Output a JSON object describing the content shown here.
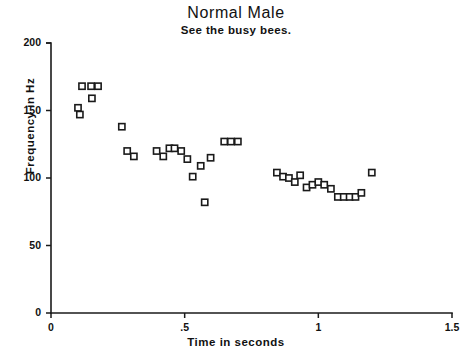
{
  "chart_data": {
    "type": "scatter",
    "title": "Normal Male",
    "subtitle": "See the busy bees.",
    "xlabel": "Time in seconds",
    "ylabel": "Frequency in Hz",
    "xlim": [
      0,
      1.5
    ],
    "ylim": [
      0,
      200
    ],
    "xticks": [
      0,
      0.5,
      1,
      1.5
    ],
    "xtick_labels": [
      "0",
      ".5",
      "1",
      "1.5"
    ],
    "yticks": [
      0,
      50,
      100,
      150,
      200
    ],
    "ytick_labels": [
      "0",
      "50",
      "100",
      "150",
      "200"
    ],
    "grid": false,
    "legend": null,
    "marker": "open-square",
    "marker_color": "#1a1a1a",
    "points": [
      {
        "x": 0.108,
        "y": 147
      },
      {
        "x": 0.116,
        "y": 168
      },
      {
        "x": 0.15,
        "y": 168
      },
      {
        "x": 0.176,
        "y": 168
      },
      {
        "x": 0.153,
        "y": 159
      },
      {
        "x": 0.101,
        "y": 152
      },
      {
        "x": 0.265,
        "y": 138
      },
      {
        "x": 0.285,
        "y": 120
      },
      {
        "x": 0.31,
        "y": 116
      },
      {
        "x": 0.395,
        "y": 120
      },
      {
        "x": 0.42,
        "y": 116
      },
      {
        "x": 0.443,
        "y": 122
      },
      {
        "x": 0.462,
        "y": 122
      },
      {
        "x": 0.487,
        "y": 120
      },
      {
        "x": 0.51,
        "y": 114
      },
      {
        "x": 0.53,
        "y": 101
      },
      {
        "x": 0.575,
        "y": 82
      },
      {
        "x": 0.56,
        "y": 109
      },
      {
        "x": 0.597,
        "y": 115
      },
      {
        "x": 0.648,
        "y": 127
      },
      {
        "x": 0.673,
        "y": 127
      },
      {
        "x": 0.699,
        "y": 127
      },
      {
        "x": 0.845,
        "y": 104
      },
      {
        "x": 0.868,
        "y": 101
      },
      {
        "x": 0.89,
        "y": 100
      },
      {
        "x": 0.912,
        "y": 97
      },
      {
        "x": 0.932,
        "y": 102
      },
      {
        "x": 0.956,
        "y": 93
      },
      {
        "x": 0.978,
        "y": 95
      },
      {
        "x": 1.0,
        "y": 97
      },
      {
        "x": 1.022,
        "y": 95
      },
      {
        "x": 1.047,
        "y": 92
      },
      {
        "x": 1.073,
        "y": 86
      },
      {
        "x": 1.095,
        "y": 86
      },
      {
        "x": 1.117,
        "y": 86
      },
      {
        "x": 1.139,
        "y": 86
      },
      {
        "x": 1.161,
        "y": 89
      },
      {
        "x": 1.2,
        "y": 104
      }
    ]
  },
  "figure": {
    "background": "#ffffff",
    "foreground": "#1a1a1a"
  }
}
